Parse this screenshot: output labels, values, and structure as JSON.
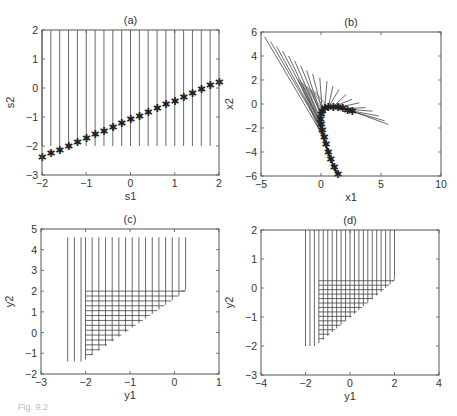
{
  "figure": {
    "caption_fragment": "Fig. 9.2"
  },
  "chart_data": [
    {
      "id": "a",
      "type": "line",
      "title": "(a)",
      "xlabel": "s1",
      "ylabel": "s2",
      "xlim": [
        -2,
        2
      ],
      "ylim": [
        -3,
        2
      ],
      "xticks": [
        -2,
        -1,
        0,
        1,
        2
      ],
      "yticks": [
        -3,
        -2,
        -1,
        0,
        1,
        2
      ],
      "grid": false,
      "box": {
        "x0": 42,
        "y0": 30,
        "x1": 219,
        "y1": 175
      },
      "description": "21 vertical lines at s1 = -2..2 step 0.2 from s2 = -2 up to 2; star markers on line s2 = 0.65*s1 - 1.1",
      "vertical_lines": {
        "x_start": -2,
        "x_end": 2,
        "step": 0.2,
        "y_bottom": -2,
        "y_top": 2,
        "first_full_drop_to_marker": true
      },
      "markers": {
        "symbol": "*",
        "slope": 0.65,
        "intercept": -1.1,
        "x_start": -2,
        "x_end": 2,
        "step": 0.2
      }
    },
    {
      "id": "b",
      "type": "line",
      "title": "(b)",
      "xlabel": "x1",
      "ylabel": "x2",
      "xlim": [
        -5,
        10
      ],
      "ylim": [
        -6,
        6
      ],
      "xticks": [
        -5,
        0,
        5,
        10
      ],
      "yticks": [
        -6,
        -4,
        -2,
        0,
        2,
        4,
        6
      ],
      "grid": false,
      "box": {
        "x0": 261,
        "y0": 32,
        "x1": 441,
        "y1": 176
      },
      "description": "Fan of straight rays emanating from a curved (boomerang-shaped) locus of star markers; rays extend to upper-left and right",
      "markers_curve": [
        [
          1.4,
          -5.9
        ],
        [
          1.1,
          -5.3
        ],
        [
          0.8,
          -4.6
        ],
        [
          0.6,
          -4.0
        ],
        [
          0.4,
          -3.4
        ],
        [
          0.25,
          -2.8
        ],
        [
          0.1,
          -2.2
        ],
        [
          0.0,
          -1.7
        ],
        [
          -0.05,
          -1.3
        ],
        [
          0.0,
          -0.9
        ],
        [
          0.1,
          -0.6
        ],
        [
          0.3,
          -0.4
        ],
        [
          0.6,
          -0.3
        ],
        [
          1.0,
          -0.25
        ],
        [
          1.4,
          -0.3
        ],
        [
          1.8,
          -0.4
        ],
        [
          2.2,
          -0.5
        ],
        [
          2.6,
          -0.6
        ]
      ],
      "ray_ends": [
        [
          -4.7,
          5.6
        ],
        [
          -4.2,
          5.2
        ],
        [
          -3.7,
          4.8
        ],
        [
          -3.2,
          4.4
        ],
        [
          -2.7,
          4.0
        ],
        [
          -2.2,
          3.6
        ],
        [
          -1.7,
          3.2
        ],
        [
          -1.2,
          2.8
        ],
        [
          -0.7,
          2.5
        ],
        [
          -0.1,
          2.2
        ],
        [
          0.5,
          1.9
        ],
        [
          1.0,
          1.5
        ],
        [
          1.5,
          1.2
        ],
        [
          2.1,
          0.8
        ],
        [
          2.6,
          0.4
        ],
        [
          3.2,
          0.1
        ],
        [
          3.7,
          -0.3
        ],
        [
          4.3,
          -0.6
        ],
        [
          4.8,
          -1.0
        ],
        [
          5.3,
          -1.4
        ],
        [
          5.6,
          -1.7
        ]
      ]
    },
    {
      "id": "c",
      "type": "line",
      "title": "(c)",
      "xlabel": "y1",
      "ylabel": "y2",
      "xlim": [
        -3,
        1
      ],
      "ylim": [
        -2,
        5
      ],
      "xticks": [
        -3,
        -2,
        -1,
        0,
        1
      ],
      "yticks": [
        -2,
        -1,
        0,
        1,
        2,
        3,
        4,
        5
      ],
      "grid": false,
      "box": {
        "x0": 41,
        "y0": 229,
        "x1": 219,
        "y1": 374
      },
      "description": "Vertical lines at y1 from -2.4 to 0.25 reaching y2 = 4.6; triangular mesh of horizontal lines from y1=-2 with staircase diagonal edge",
      "vertical_x": [
        -2.4,
        -2.25,
        -2.1,
        -2.0,
        -1.85,
        -1.7,
        -1.55,
        -1.4,
        -1.25,
        -1.1,
        -0.95,
        -0.8,
        -0.65,
        -0.5,
        -0.35,
        -0.2,
        -0.05,
        0.1,
        0.25
      ],
      "top_y": 4.6,
      "left_bottom_y": -1.4,
      "mesh": {
        "x_left": -2.0,
        "y_top": 2.0,
        "y_bottom": -1.3,
        "x_right_at_top": 0.25,
        "rows": 14
      }
    },
    {
      "id": "d",
      "type": "line",
      "title": "(d)",
      "xlabel": "y1",
      "ylabel": "y2",
      "xlim": [
        -4,
        4
      ],
      "ylim": [
        -3,
        2
      ],
      "xticks": [
        -4,
        -2,
        0,
        2,
        4
      ],
      "yticks": [
        -3,
        -2,
        -1,
        0,
        1,
        2
      ],
      "grid": false,
      "box": {
        "x0": 261,
        "y0": 230,
        "x1": 439,
        "y1": 375
      },
      "description": "Vertical lines at y1 from -2 to 2 reaching y2 = 2; triangular mesh of horizontal lines from y1 = -1.4 with staircase diagonal edge",
      "vertical_x": [
        -2.0,
        -1.8,
        -1.6,
        -1.4,
        -1.2,
        -1.0,
        -0.8,
        -0.6,
        -0.4,
        -0.2,
        0.0,
        0.2,
        0.4,
        0.6,
        0.8,
        1.0,
        1.2,
        1.4,
        1.6,
        1.8,
        2.0
      ],
      "top_y": 2.0,
      "left_bottom_y": -2.0,
      "mesh": {
        "x_left": -1.4,
        "y_top": 0.25,
        "y_bottom": -1.9,
        "x_right_at_top": 2.0,
        "rows": 14
      }
    }
  ]
}
